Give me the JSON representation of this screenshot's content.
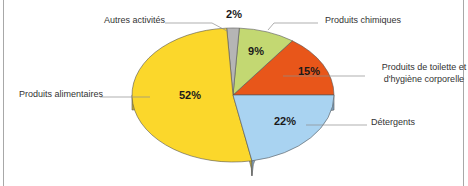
{
  "chart_data": {
    "type": "pie",
    "style": "3d",
    "title": "",
    "slices": [
      {
        "label": "Produits de toilette et d'hygiène corporelle",
        "label_lines": [
          "Produits de toilette et",
          "d'hygiène corporelle"
        ],
        "value": 15,
        "pct_label": "15%",
        "color": "#e8561a",
        "side_color": "#b34412"
      },
      {
        "label": "Produits chimiques",
        "label_lines": [
          "Produits chimiques"
        ],
        "value": 9,
        "pct_label": "9%",
        "color": "#c3d872",
        "side_color": "#98a858"
      },
      {
        "label": "Autres activités",
        "label_lines": [
          "Autres activités"
        ],
        "value": 2,
        "pct_label": "2%",
        "color": "#b5b5b5",
        "side_color": "#8a8a8a"
      },
      {
        "label": "Produits alimentaires",
        "label_lines": [
          "Produits alimentaires"
        ],
        "value": 52,
        "pct_label": "52%",
        "color": "#fbd72b",
        "side_color": "#c8b032"
      },
      {
        "label": "Détergents",
        "label_lines": [
          "Détergents"
        ],
        "value": 22,
        "pct_label": "22%",
        "color": "#a9d3f1",
        "side_color": "#7fa1be"
      }
    ],
    "legend": "callout labels",
    "unit": "%"
  }
}
